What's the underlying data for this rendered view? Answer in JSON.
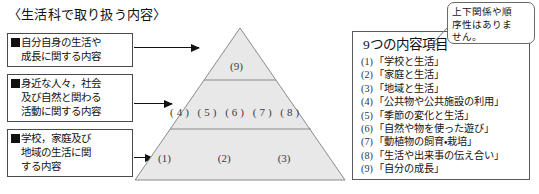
{
  "title": "〈生活科で取り扱う内容〉",
  "description_boxes": [
    {
      "name": "self-growth-content",
      "lines": [
        "自分自身の生活や",
        "成長に関する内容"
      ]
    },
    {
      "name": "people-society-nature-content",
      "lines": [
        "身近な人々，社会",
        "及び自然と関わる",
        "活動に関する内容"
      ]
    },
    {
      "name": "school-home-community-content",
      "lines": [
        "学校，家庭及び",
        "地域の生活に関",
        "する内容"
      ]
    }
  ],
  "pyramid": {
    "tiers": [
      {
        "name": "top",
        "label": "(9)"
      },
      {
        "name": "middle",
        "label": "(4) (5) (6) (7) (8)"
      },
      {
        "name": "bottom",
        "numbers": [
          "(1)",
          "(2)",
          "(3)"
        ]
      }
    ],
    "fill_color": "#e8e8e8",
    "stroke_color": "#8a8a8a"
  },
  "panel": {
    "heading": "9つの内容項目",
    "items": [
      {
        "num": "(1)",
        "text": "「学校と生活」"
      },
      {
        "num": "(2)",
        "text": "「家庭と生活」"
      },
      {
        "num": "(3)",
        "text": "「地域と生活」"
      },
      {
        "num": "(4)",
        "text": "「公共物や公共施設の利用」"
      },
      {
        "num": "(5)",
        "text": "「季節の変化と生活」"
      },
      {
        "num": "(6)",
        "text": "「自然や物を使った遊び」"
      },
      {
        "num": "(7)",
        "text": "「動植物の飼育・栽培」"
      },
      {
        "num": "(8)",
        "text": "「生活や出来事の伝え合い」"
      },
      {
        "num": "(9)",
        "text": "「自分の成長」"
      }
    ]
  },
  "callout": {
    "lines": [
      "上下関係や順",
      "序性はありま",
      "せん。"
    ]
  }
}
